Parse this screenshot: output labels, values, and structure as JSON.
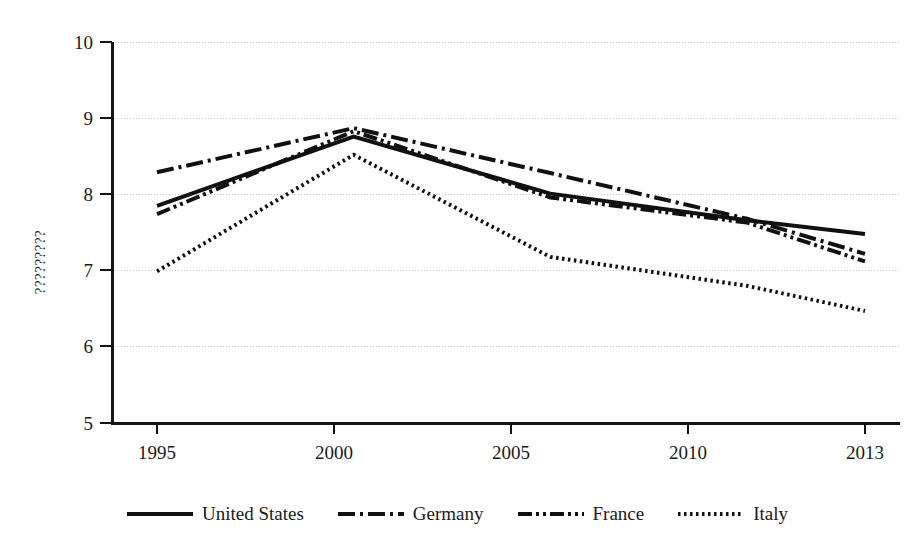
{
  "chart_data": {
    "type": "line",
    "title": "",
    "subtitle": "",
    "xlabel": "",
    "ylabel": "?????????",
    "x": [
      1995,
      2000,
      2005,
      2010,
      2013
    ],
    "categories": [
      "1995",
      "2000",
      "2005",
      "2010",
      "2013"
    ],
    "xlim": [
      1995,
      2013
    ],
    "ylim": [
      5,
      10
    ],
    "y_ticks": [
      5,
      6,
      7,
      8,
      9,
      10
    ],
    "x_ticks": [
      1995,
      2000,
      2005,
      2010,
      2013
    ],
    "grid": true,
    "legend_position": "bottom",
    "series": [
      {
        "name": "United States",
        "line_style": "solid",
        "color": "#101010",
        "values": [
          7.85,
          8.76,
          8.01,
          7.66,
          7.48
        ]
      },
      {
        "name": "Germany",
        "line_style": "dash-dot",
        "color": "#101010",
        "values": [
          8.29,
          8.87,
          8.28,
          7.68,
          7.22
        ]
      },
      {
        "name": "France",
        "line_style": "dash-dot-dot",
        "color": "#101010",
        "values": [
          7.74,
          8.83,
          7.96,
          7.63,
          7.12
        ]
      },
      {
        "name": "Italy",
        "line_style": "dotted",
        "color": "#101010",
        "values": [
          6.99,
          8.52,
          7.18,
          6.8,
          6.47
        ]
      }
    ]
  },
  "axes": {
    "y_tick_labels": [
      "10",
      "9",
      "8",
      "7",
      "6",
      "5"
    ],
    "x_tick_labels": [
      "1995",
      "2000",
      "2005",
      "2010",
      "2013"
    ],
    "y_axis_title": "?????????"
  },
  "legend": {
    "items": [
      {
        "label": "United States",
        "style": "solid"
      },
      {
        "label": "Germany",
        "style": "dash-dot"
      },
      {
        "label": "France",
        "style": "dash-dot-dot"
      },
      {
        "label": "Italy",
        "style": "dotted"
      }
    ]
  },
  "colors": {
    "ink": "#101010",
    "axis": "#141414",
    "grid": "#c9c9c9",
    "background": "#ffffff"
  }
}
